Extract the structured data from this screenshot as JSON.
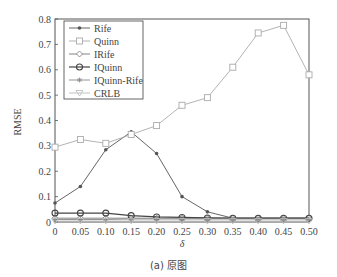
{
  "caption": "(a) 原图",
  "chart_data": {
    "type": "line",
    "title": "",
    "xlabel": "δ",
    "ylabel": "RMSE",
    "xlim": [
      0,
      0.5
    ],
    "ylim": [
      0,
      0.8
    ],
    "grid": false,
    "legend_position": "upper left",
    "x": [
      0,
      0.05,
      0.1,
      0.15,
      0.2,
      0.25,
      0.3,
      0.35,
      0.4,
      0.45,
      0.5
    ],
    "xticks": [
      "0",
      "0.05",
      "0.10",
      "0.15",
      "0.20",
      "0.25",
      "0.30",
      "0.35",
      "0.40",
      "0.45",
      "0.50"
    ],
    "yticks": [
      "0",
      "0.1",
      "0.2",
      "0.3",
      "0.4",
      "0.5",
      "0.6",
      "0.7",
      "0.8"
    ],
    "series": [
      {
        "name": "Rife",
        "marker": "dot",
        "color": "#555555",
        "values": [
          0.075,
          0.14,
          0.285,
          0.355,
          0.27,
          0.1,
          0.04,
          0.015,
          0.015,
          0.015,
          0.015
        ]
      },
      {
        "name": "Quinn",
        "marker": "square",
        "color": "#aaaaaa",
        "values": [
          0.295,
          0.325,
          0.31,
          0.345,
          0.38,
          0.46,
          0.49,
          0.61,
          0.745,
          0.775,
          0.58
        ]
      },
      {
        "name": "IRife",
        "marker": "diamond",
        "color": "#777777",
        "values": [
          0.015,
          0.015,
          0.015,
          0.015,
          0.015,
          0.015,
          0.015,
          0.015,
          0.015,
          0.015,
          0.015
        ]
      },
      {
        "name": "IQuinn",
        "marker": "circle",
        "color": "#444444",
        "values": [
          0.035,
          0.035,
          0.035,
          0.025,
          0.02,
          0.018,
          0.016,
          0.015,
          0.015,
          0.015,
          0.015
        ]
      },
      {
        "name": "IQuinn-Rife",
        "marker": "star",
        "color": "#888888",
        "values": [
          0.01,
          0.01,
          0.01,
          0.012,
          0.012,
          0.012,
          0.012,
          0.012,
          0.012,
          0.012,
          0.012
        ]
      },
      {
        "name": "CRLB",
        "marker": "triangle-down",
        "color": "#bbbbbb",
        "values": [
          0.004,
          0.004,
          0.004,
          0.004,
          0.004,
          0.004,
          0.004,
          0.004,
          0.004,
          0.004,
          0.004
        ]
      }
    ]
  }
}
